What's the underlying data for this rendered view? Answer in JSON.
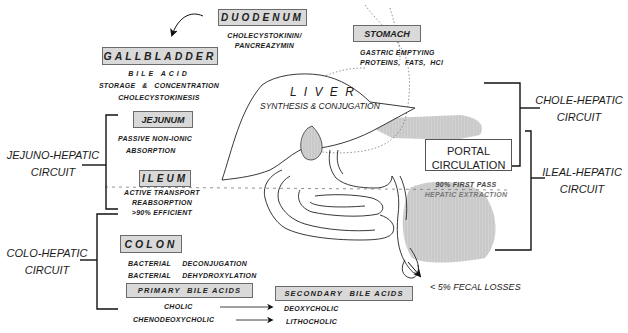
{
  "organs": {
    "duodenum": {
      "title": "DUODENUM",
      "lines": [
        "CHOLECYSTOKININ/",
        "PANCREAZYMIN"
      ]
    },
    "gallbladder": {
      "title": "GALLBLADDER",
      "lines": [
        "BILE ACID",
        "STORAGE   &   CONCENTRATION",
        "CHOLECYSTOKINESIS"
      ]
    },
    "stomach": {
      "title": "STOMACH",
      "lines": [
        "GASTRIC EMPTYING",
        "PROTEINS,  FATS,  HCl"
      ]
    },
    "liver": {
      "title": "L I V E R",
      "subtitle": "SYNTHESIS & CONJUGATION"
    },
    "jejunum": {
      "title": "JEJUNUM",
      "lines": [
        "PASSIVE NON-IONIC",
        "ABSORPTION"
      ]
    },
    "ileum": {
      "title": "ILEUM",
      "lines": [
        "ACTIVE TRANSPORT",
        "REABSORPTION",
        ">90% EFFICIENT"
      ]
    },
    "colon": {
      "title": "COLON",
      "lines": [
        "BACTERIAL     DECONJUGATION",
        "BACTERIAL     DEHYDROXYLATION"
      ]
    }
  },
  "portal": {
    "title_line1": "PORTAL",
    "title_line2": "CIRCULATION",
    "lines": [
      "90% FIRST PASS",
      "HEPATIC EXTRACTION"
    ]
  },
  "circuits": {
    "jejuno_hepatic": [
      "JEJUNO-HEPATIC",
      "CIRCUIT"
    ],
    "colo_hepatic": [
      "COLO-HEPATIC",
      "CIRCUIT"
    ],
    "chole_hepatic": [
      "CHOLE-HEPATIC",
      "CIRCUIT"
    ],
    "ileal_hepatic": [
      "ILEAL-HEPATIC",
      "CIRCUIT"
    ]
  },
  "bile_acids": {
    "primary_title": "PRIMARY  BILE ACIDS",
    "secondary_title": "SECONDARY  BILE ACIDS",
    "conversions": [
      {
        "from": "CHOLIC",
        "to": "DEOXYCHOLIC"
      },
      {
        "from": "CHENODEOXYCHOLIC",
        "to": "LITHOCHOLIC"
      }
    ]
  },
  "fecal_losses": "< 5% FECAL LOSSES",
  "colors": {
    "box_fill": "#d9d9d9",
    "box_border": "#6a6a6a",
    "shading": "#cfcfcf",
    "line": "#1a1a1a"
  }
}
